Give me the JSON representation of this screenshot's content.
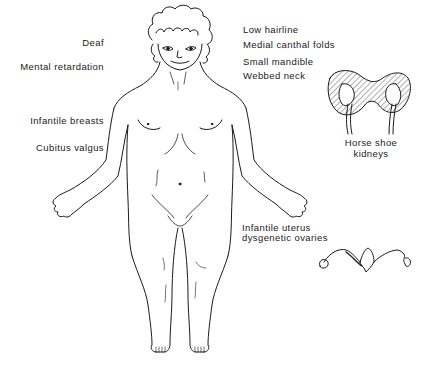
{
  "diagram": {
    "labels_left": [
      {
        "id": "deaf",
        "text": "Deaf"
      },
      {
        "id": "mental-retardation",
        "text": "Mental retardation"
      },
      {
        "id": "infantile-breasts",
        "text": "Infantile breasts"
      },
      {
        "id": "cubitus-valgus",
        "text": "Cubitus valgus"
      }
    ],
    "labels_right": [
      {
        "id": "low-hairline",
        "text": "Low hairline"
      },
      {
        "id": "medial-canthal-folds",
        "text": "Medial canthal folds"
      },
      {
        "id": "small-mandible",
        "text": "Small mandible"
      },
      {
        "id": "webbed-neck",
        "text": "Webbed neck"
      }
    ],
    "kidney": {
      "line1": "Horse shoe",
      "line2": "kidneys"
    },
    "uterus": {
      "line1": "Infantile uterus",
      "line2": "dysgenetic ovaries"
    },
    "colors": {
      "ink": "#1a1a1a",
      "background": "#ffffff"
    }
  }
}
